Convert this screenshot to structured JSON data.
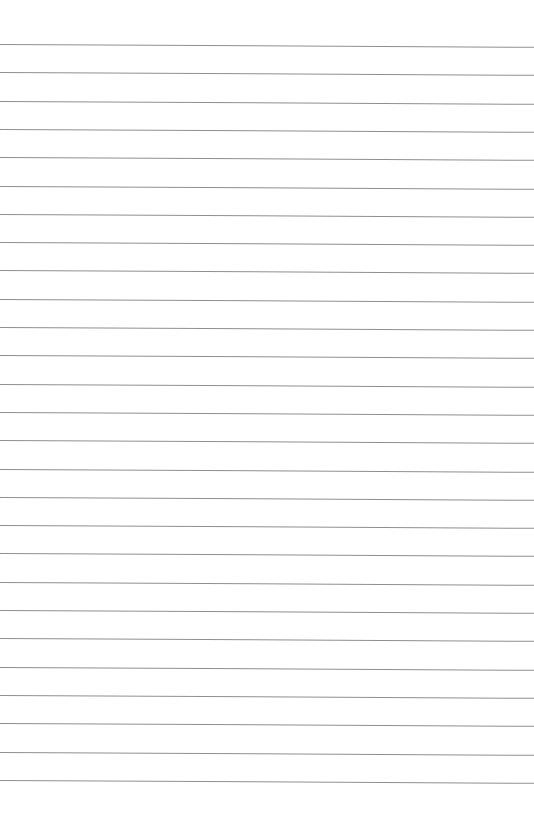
{
  "page": {
    "type": "lined-paper",
    "background_color": "#ffffff",
    "line_color": "#8f8f8f",
    "line_count": 27,
    "first_line_y": 44,
    "line_spacing": 28.3
  }
}
